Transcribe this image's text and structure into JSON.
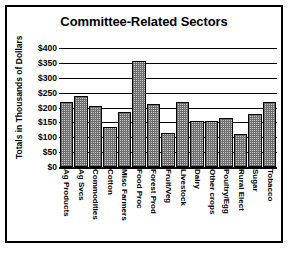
{
  "chart_data": {
    "type": "bar",
    "title": "Committee-Related Sectors",
    "xlabel": "",
    "ylabel": "Totals in Thousands of Dollars",
    "ylim": [
      0,
      400
    ],
    "ytick_values": [
      400,
      350,
      300,
      250,
      200,
      150,
      100,
      50,
      0
    ],
    "ytick_labels": [
      "$400",
      "$350",
      "$300",
      "$250",
      "$200",
      "$150",
      "$100",
      "$50",
      "$0"
    ],
    "grid": true,
    "legend": null,
    "bar_fill": "#c8c8c8",
    "bar_edge": "#000000",
    "categories": [
      "Ag Products",
      "Ag Svcs",
      "Commodities",
      "Cotton",
      "Misc Farmers",
      "Food Proc",
      "Forest Prod",
      "Fruit/Veg",
      "Livestock",
      "Dairy",
      "Other crops",
      "Poultry/Egg",
      "Rural Elect",
      "Sugar",
      "Tobacco"
    ],
    "values": [
      218,
      238,
      205,
      135,
      185,
      355,
      212,
      115,
      220,
      155,
      155,
      165,
      110,
      178,
      218
    ]
  }
}
